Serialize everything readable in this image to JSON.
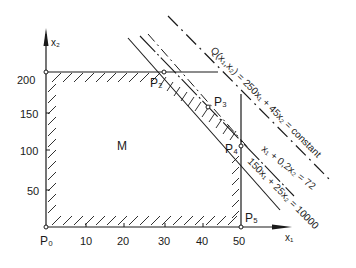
{
  "diagram": {
    "type": "linear-programming-feasible-region",
    "region_label": "M",
    "axes": {
      "x_label": "x₁",
      "y_label": "x₂",
      "x_ticks": [
        "10",
        "20",
        "30",
        "40",
        "50"
      ],
      "y_ticks": [
        "200",
        "150",
        "100",
        "50"
      ]
    },
    "points": {
      "p0": "P₀",
      "p2": "P₂",
      "p3": "P₃",
      "p4": "P₄",
      "p5": "P₅"
    },
    "lines": {
      "objective": "Q(x₁,x₂) = 250x₁ + 45x₂ = constant",
      "constraint_1": "x₁ + 0,2x₂ = 72",
      "constraint_2": "150x₁ + 25x₂ = 10000"
    },
    "colors": {
      "ink": "#1a1a1a",
      "background": "#ffffff"
    }
  }
}
